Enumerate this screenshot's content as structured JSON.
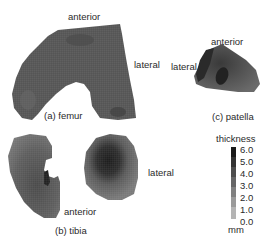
{
  "figure": {
    "panels": [
      {
        "id": "a",
        "caption": "(a) femur",
        "labels": {
          "top": "anterior",
          "side": "lateral"
        }
      },
      {
        "id": "b",
        "caption": "(b) tibia",
        "labels": {
          "bottom": "anterior",
          "side": "lateral"
        }
      },
      {
        "id": "c",
        "caption": "(c) patella",
        "labels": {
          "top": "anterior",
          "side": "lateral"
        }
      }
    ],
    "colorbar": {
      "title": "thickness",
      "unit": "mm",
      "ticks": [
        "6.0",
        "5.0",
        "4.0",
        "3.0",
        "2.0",
        "1.0",
        "0.0"
      ],
      "colors": [
        "#1a1a1a",
        "#333333",
        "#4d4d4d",
        "#666666",
        "#808080",
        "#9a9a9a",
        "#b4b4b4"
      ]
    }
  }
}
